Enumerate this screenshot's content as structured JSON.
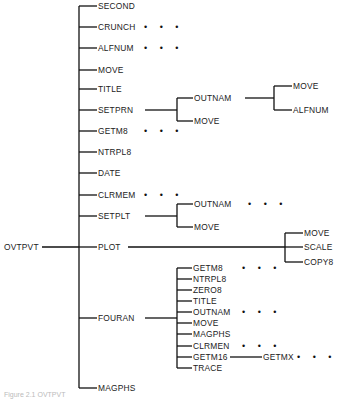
{
  "root": "OVTPVT",
  "level1": [
    {
      "label": "SECOND",
      "y": 6
    },
    {
      "label": "CRUNCH",
      "y": 27,
      "dots": true
    },
    {
      "label": "ALFNUM",
      "y": 48,
      "dots": true
    },
    {
      "label": "MOVE",
      "y": 70
    },
    {
      "label": "TITLE",
      "y": 89
    },
    {
      "label": "SETPRN",
      "y": 110
    },
    {
      "label": "GETM8",
      "y": 131,
      "dots": true
    },
    {
      "label": "NTRPL8",
      "y": 152
    },
    {
      "label": "DATE",
      "y": 173
    },
    {
      "label": "CLRMEM",
      "y": 195,
      "dots": true
    },
    {
      "label": "SETPLT",
      "y": 216
    },
    {
      "label": "PLOT",
      "y": 247
    },
    {
      "label": "FOURAN",
      "y": 318
    },
    {
      "label": "MAGPHS",
      "y": 388
    }
  ],
  "setprn_children": [
    {
      "label": "OUTNAM",
      "y": 98
    },
    {
      "label": "MOVE",
      "y": 121
    }
  ],
  "outnam_children": [
    {
      "label": "MOVE",
      "y": 86
    },
    {
      "label": "ALFNUM",
      "y": 110
    }
  ],
  "setplt_children": [
    {
      "label": "OUTNAM",
      "y": 204,
      "dots": true
    },
    {
      "label": "MOVE",
      "y": 227
    }
  ],
  "plot_children": [
    {
      "label": "MOVE",
      "y": 233
    },
    {
      "label": "SCALE",
      "y": 247
    },
    {
      "label": "COPY8",
      "y": 262
    }
  ],
  "fouran_children": [
    {
      "label": "GETM8",
      "y": 268,
      "dots": true
    },
    {
      "label": "NTRPL8",
      "y": 279
    },
    {
      "label": "ZERO8",
      "y": 290
    },
    {
      "label": "TITLE",
      "y": 301
    },
    {
      "label": "OUTNAM",
      "y": 312,
      "dots": true
    },
    {
      "label": "MOVE",
      "y": 323
    },
    {
      "label": "MAGPHS",
      "y": 334
    },
    {
      "label": "CLRMEN",
      "y": 346,
      "dots": true
    },
    {
      "label": "GETM16",
      "y": 357
    },
    {
      "label": "TRACE",
      "y": 368
    }
  ],
  "getm16_children": [
    {
      "label": "GETMX",
      "y": 357,
      "dots": true
    }
  ],
  "ellipsis": "• • •",
  "caption": "Figure 2.1    OVTPVT"
}
